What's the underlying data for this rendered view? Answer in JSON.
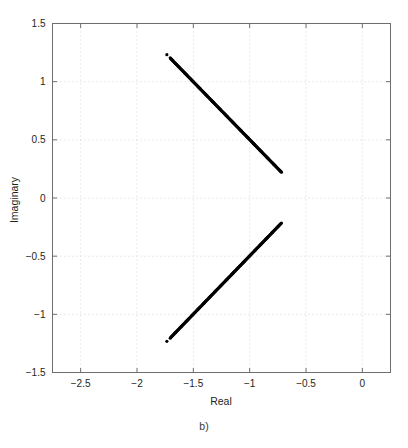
{
  "figure": {
    "caption": "b)",
    "background": "#ffffff",
    "foreground": "#231f20",
    "grid_color": "#cccccc",
    "axis_color": "#6e6e6e",
    "marker_color": "#000000"
  },
  "chart_data": {
    "type": "scatter",
    "title": "",
    "subtitle": "",
    "xlabel": "Real",
    "ylabel": "Imaginary",
    "xlim": [
      -2.75,
      0.25
    ],
    "ylim": [
      -1.5,
      1.5
    ],
    "xticks": [
      -2.5,
      -2,
      -1.5,
      -1,
      -0.5,
      0
    ],
    "xticklabels": [
      "−2.5",
      "−2",
      "−1.5",
      "−1",
      "−0.5",
      "0"
    ],
    "yticks": [
      -1.5,
      -1,
      -0.5,
      0,
      0.5,
      1,
      1.5
    ],
    "yticklabels": [
      "−1.5",
      "−1",
      "−0.5",
      "0",
      "0.5",
      "1",
      "1.5"
    ],
    "grid": true,
    "grid_style": "dotted",
    "legend": null,
    "legend_position": "none",
    "annotations": [],
    "marker": "dot",
    "marker_size": 1.6,
    "series": [
      {
        "name": "upper-branch-outliers",
        "comment": "isolated points above the dense locus",
        "x": [
          -1.735,
          -1.705
        ],
        "y": [
          1.232,
          1.205
        ]
      },
      {
        "name": "upper-branch-locus",
        "comment": "dense near-linear locus of eigenvalues, descending left to right",
        "x_start": -1.7,
        "y_start": 1.198,
        "x_end": -0.718,
        "y_end": 0.222,
        "n_points": 220
      },
      {
        "name": "lower-branch-outliers",
        "comment": "isolated points below the dense locus (complex conjugates)",
        "x": [
          -1.735,
          -1.705
        ],
        "y": [
          -1.232,
          -1.205
        ]
      },
      {
        "name": "lower-branch-locus",
        "comment": "dense near-linear locus, ascending left to right (conjugate of upper)",
        "x_start": -1.7,
        "y_start": -1.198,
        "x_end": -0.718,
        "y_end": -0.215,
        "n_points": 220
      }
    ]
  }
}
